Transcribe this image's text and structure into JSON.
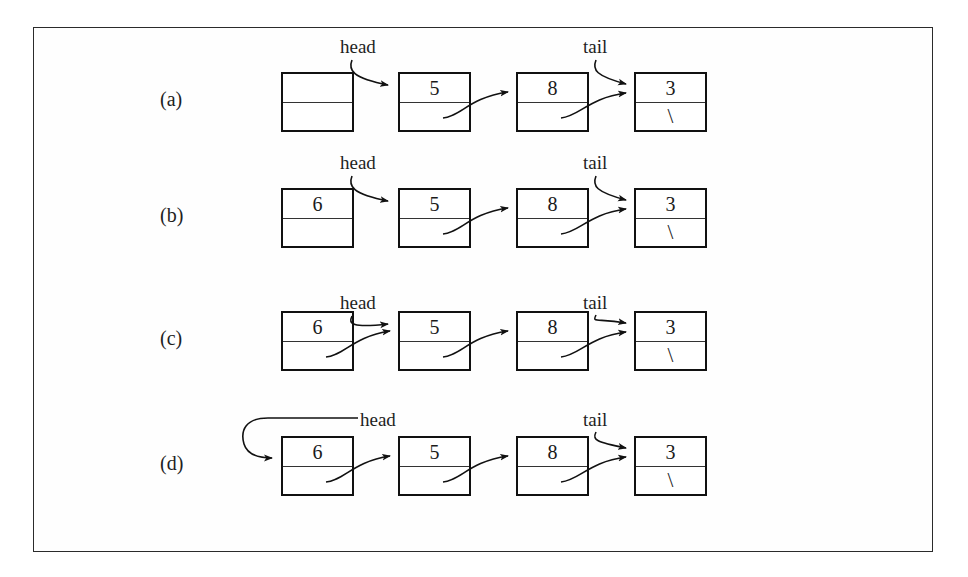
{
  "figure": {
    "kind": "linked-list-insertion-diagram",
    "frame": {
      "border_color": "#2b2b2b",
      "background": "#fefefe"
    },
    "null_symbol": "\\",
    "pointer_labels": {
      "head": "head",
      "tail": "tail"
    },
    "rows": [
      {
        "label": "(a)",
        "nodes": [
          {
            "value": "",
            "next": ""
          },
          {
            "value": "5",
            "next": "link"
          },
          {
            "value": "8",
            "next": "link"
          },
          {
            "value": "3",
            "next": "null"
          }
        ],
        "head_target": "node-2",
        "tail_target": "node-4",
        "head_style": "curve-down",
        "caption": "new empty node allocated; head points to 5, tail points to 3"
      },
      {
        "label": "(b)",
        "nodes": [
          {
            "value": "6",
            "next": ""
          },
          {
            "value": "5",
            "next": "link"
          },
          {
            "value": "8",
            "next": "link"
          },
          {
            "value": "3",
            "next": "null"
          }
        ],
        "head_target": "node-2",
        "tail_target": "node-4",
        "head_style": "curve-down",
        "caption": "value 6 stored in the new node"
      },
      {
        "label": "(c)",
        "nodes": [
          {
            "value": "6",
            "next": "link"
          },
          {
            "value": "5",
            "next": "link"
          },
          {
            "value": "8",
            "next": "link"
          },
          {
            "value": "3",
            "next": "null"
          }
        ],
        "head_target": "node-2",
        "tail_target": "node-4",
        "head_style": "curve-down",
        "caption": "new node's next set to old head (5)"
      },
      {
        "label": "(d)",
        "nodes": [
          {
            "value": "6",
            "next": "link"
          },
          {
            "value": "5",
            "next": "link"
          },
          {
            "value": "8",
            "next": "link"
          },
          {
            "value": "3",
            "next": "null"
          }
        ],
        "head_target": "node-1",
        "tail_target": "node-4",
        "head_style": "left-hook",
        "caption": "head updated to point at the new node (6)"
      }
    ],
    "geometry": {
      "node_x": [
        281,
        398,
        516,
        634
      ],
      "row_y": [
        72,
        188,
        311,
        436
      ],
      "node_width": 73,
      "node_height": 60,
      "label_x": 160,
      "head_label_x": [
        340,
        340,
        340,
        360
      ],
      "tail_label_x": 580
    }
  }
}
